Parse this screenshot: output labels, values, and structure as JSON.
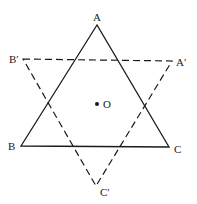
{
  "diagram": {
    "type": "geometry",
    "colors": {
      "stroke": "#1a1a1a",
      "background": "#ffffff"
    },
    "points": {
      "A": {
        "label": "A",
        "x": 97,
        "y": 25
      },
      "B": {
        "label": "B",
        "x": 21,
        "y": 146
      },
      "C": {
        "label": "C",
        "x": 169,
        "y": 147
      },
      "A'": {
        "label": "A′",
        "x": 172,
        "y": 61
      },
      "B'": {
        "label": "B′",
        "x": 23,
        "y": 59
      },
      "C'": {
        "label": "C′",
        "x": 96,
        "y": 186
      },
      "O": {
        "label": "O",
        "x": 97,
        "y": 104
      }
    },
    "triangles": [
      {
        "name": "ABC",
        "style": "solid",
        "vertices": [
          "A",
          "B",
          "C"
        ]
      },
      {
        "name": "A'B'C'",
        "style": "dashed",
        "vertices": [
          "A'",
          "B'",
          "C'"
        ]
      }
    ],
    "labels": {
      "A": "A",
      "B": "B",
      "C": "C",
      "A_prime": "A′",
      "B_prime": "B′",
      "C_prime": "C′",
      "O": "O"
    }
  }
}
